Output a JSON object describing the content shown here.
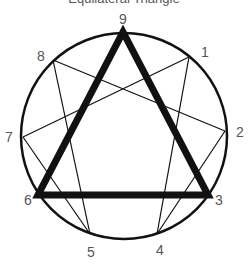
{
  "title": "Equilateral Triangle",
  "colors": {
    "stroke": "#111111",
    "label": "#555555",
    "background": "#ffffff"
  },
  "circle": {
    "cx": 124,
    "cy": 136,
    "r": 103
  },
  "points": [
    {
      "id": "9",
      "x": 123,
      "y": 32,
      "lx": 123,
      "ly": 24
    },
    {
      "id": "1",
      "x": 189,
      "y": 57,
      "lx": 205,
      "ly": 57
    },
    {
      "id": "2",
      "x": 225,
      "y": 131,
      "lx": 240,
      "ly": 137
    },
    {
      "id": "3",
      "x": 208,
      "y": 195,
      "lx": 219,
      "ly": 205
    },
    {
      "id": "4",
      "x": 157,
      "y": 234,
      "lx": 160,
      "ly": 255
    },
    {
      "id": "5",
      "x": 90,
      "y": 234,
      "lx": 91,
      "ly": 257
    },
    {
      "id": "6",
      "x": 38,
      "y": 195,
      "lx": 28,
      "ly": 205
    },
    {
      "id": "7",
      "x": 23,
      "y": 137,
      "lx": 9,
      "ly": 142
    },
    {
      "id": "8",
      "x": 53,
      "y": 60,
      "lx": 41,
      "ly": 61
    }
  ],
  "triangle": [
    "9",
    "3",
    "6"
  ],
  "hexad": [
    [
      "1",
      "4"
    ],
    [
      "4",
      "2"
    ],
    [
      "2",
      "8"
    ],
    [
      "8",
      "5"
    ],
    [
      "5",
      "7"
    ],
    [
      "7",
      "1"
    ]
  ]
}
